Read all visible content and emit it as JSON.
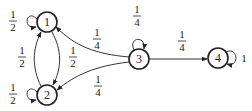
{
  "diagram": {
    "type": "markov-chain",
    "nodes": [
      {
        "id": "1",
        "label": "1",
        "x": 47,
        "y": 22
      },
      {
        "id": "2",
        "label": "2",
        "x": 47,
        "y": 95
      },
      {
        "id": "3",
        "label": "3",
        "x": 139,
        "y": 59
      },
      {
        "id": "4",
        "label": "4",
        "x": 218,
        "y": 58
      }
    ],
    "edges": [
      {
        "from": "1",
        "to": "1",
        "prob": {
          "num": "1",
          "den": "2"
        }
      },
      {
        "from": "1",
        "to": "2",
        "prob": {
          "num": "1",
          "den": "2"
        }
      },
      {
        "from": "2",
        "to": "1",
        "prob": {
          "num": "1",
          "den": "2"
        }
      },
      {
        "from": "2",
        "to": "2",
        "prob": {
          "num": "1",
          "den": "2"
        }
      },
      {
        "from": "3",
        "to": "1",
        "prob": {
          "num": "1",
          "den": "4"
        }
      },
      {
        "from": "3",
        "to": "2",
        "prob": {
          "num": "1",
          "den": "4"
        }
      },
      {
        "from": "3",
        "to": "3",
        "prob": {
          "num": "1",
          "den": "4"
        }
      },
      {
        "from": "3",
        "to": "4",
        "prob": {
          "num": "1",
          "den": "4"
        }
      },
      {
        "from": "4",
        "to": "4",
        "prob": {
          "whole": "1"
        }
      }
    ]
  }
}
